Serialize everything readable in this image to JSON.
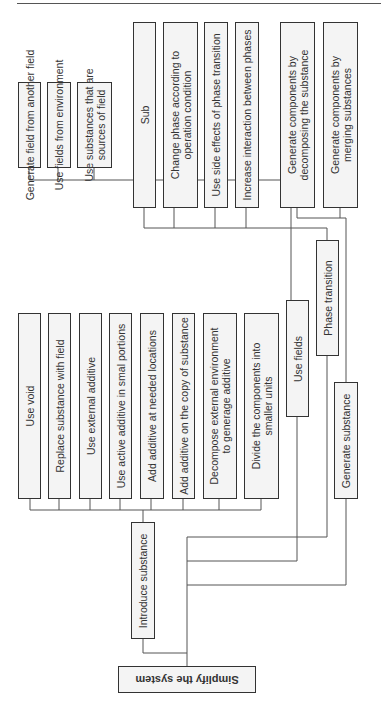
{
  "diagram": {
    "root": {
      "label": "Simplify the system"
    },
    "branches": {
      "introduce_substance": {
        "label": "Introduce substance",
        "children": [
          {
            "lines": [
              "Use void"
            ]
          },
          {
            "lines": [
              "Replace substance with field"
            ]
          },
          {
            "lines": [
              "Use external additive"
            ]
          },
          {
            "lines": [
              "Use active additive in smal portions"
            ]
          },
          {
            "lines": [
              "Add additive at needed locations"
            ]
          },
          {
            "lines": [
              "Add additive on the copy of substance"
            ]
          },
          {
            "lines": [
              "Decompose external environment",
              "to generage additive"
            ]
          },
          {
            "lines": [
              "Divide the components into",
              "smaller units"
            ]
          }
        ]
      },
      "use_fields": {
        "label": "Use fields",
        "children": [
          {
            "lines": [
              "Generate field from another field"
            ]
          },
          {
            "lines": [
              "Use fields from environment"
            ]
          },
          {
            "lines": [
              "Use substances that are",
              "sources of field"
            ]
          }
        ]
      },
      "phase_transition": {
        "label": "Phase transition",
        "children": [
          {
            "lines": [
              "Sub"
            ]
          },
          {
            "lines": [
              "Change phase according to",
              "operation condition"
            ]
          },
          {
            "lines": [
              "Use side effects of phase transition"
            ]
          },
          {
            "lines": [
              "Increase interaction between phases"
            ]
          }
        ]
      },
      "generate_substance": {
        "label": "Generate substance",
        "children": [
          {
            "lines": [
              "Generate components by",
              "decomposing the substance"
            ]
          },
          {
            "lines": [
              "Generate components by",
              "merging substances"
            ]
          }
        ]
      }
    }
  },
  "colors": {
    "line": "#555555",
    "border": "#333333",
    "box_fill": "#f4f4f4",
    "text": "#333333"
  }
}
